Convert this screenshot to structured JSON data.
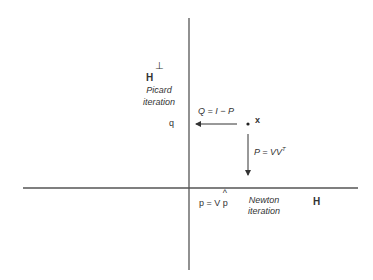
{
  "diagram": {
    "axes": {
      "vertical": {
        "x": 189,
        "y1": 18,
        "y2": 270
      },
      "horizontal": {
        "y": 188,
        "x1": 23,
        "x2": 358
      },
      "color": "#555555"
    },
    "labels": {
      "h_perp_base": "H",
      "h_perp_sup": "⊥",
      "picard_line1": "Picard",
      "picard_line2": "iteration",
      "q": "q",
      "q_operator": "Q = I − P",
      "point_x": "x",
      "p_operator_base": "P = VV",
      "p_operator_sup": "T",
      "p_eq": "p = V",
      "p_hat": "p",
      "hat": "^",
      "newton_line1": "Newton",
      "newton_line2": "iteration",
      "h": "H"
    },
    "arrows": [
      {
        "name": "Q-projection",
        "from": [
          237,
          124
        ],
        "to": [
          195,
          124
        ]
      },
      {
        "name": "P-projection",
        "from": [
          248,
          134
        ],
        "to": [
          248,
          176
        ]
      }
    ],
    "point": {
      "x": 248,
      "y": 124
    }
  }
}
